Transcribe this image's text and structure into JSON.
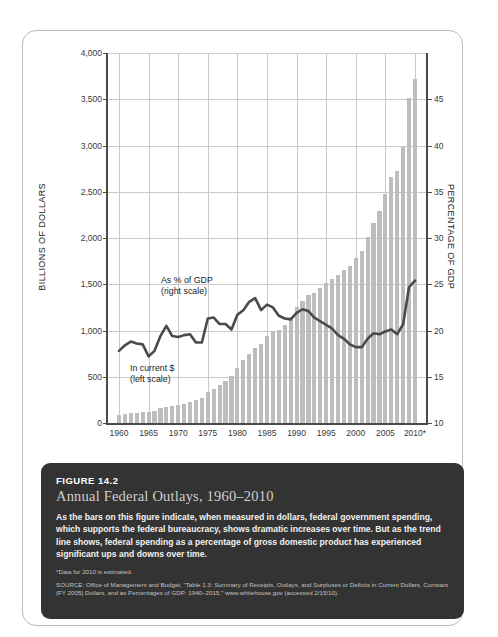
{
  "figure": {
    "number": "FIGURE 14.2",
    "title": "Annual Federal Outlays, 1960–2010",
    "body": "As the bars on this figure indicate, when measured in dollars, federal government spending, which supports the federal bureaucracy, shows dramatic increases over time. But as the trend line shows, federal spending as a percentage of gross domestic product has experienced significant ups and downs over time.",
    "note": "*Data for 2010 is estimated.",
    "source": "SOURCE: Office of Management and Budget, \"Table 1.3: Summary of Receipts, Outlays, and Surpluses or Deficits in Current Dollars, Constant (FY 2005) Dollars, and as Percentages of GDP: 1940–2015,\" www.whitehouse.gov (accessed 2/15/10).",
    "caption_bg": "#333333",
    "card_border": "#b9b9b9"
  },
  "chart_data": {
    "type": "bar",
    "title": "Annual Federal Outlays, 1960–2010",
    "xlabel": "",
    "ylabel": "BILLIONS OF DOLLARS",
    "y2label": "PERCENTAGE OF GDP",
    "ylim": [
      0,
      4000
    ],
    "y2lim": [
      10,
      50
    ],
    "grid": true,
    "legend": "inline-annotations",
    "bar_color": "#bdbdbd",
    "line_color": "#4a4a4a",
    "annotations": [
      {
        "text": "As % of GDP",
        "text2": "(right scale)",
        "series": "percent_of_gdp"
      },
      {
        "text": "In current $",
        "text2": "(left scale)",
        "series": "outlays_billions"
      }
    ],
    "yticks": [
      "0",
      "500",
      "1,000",
      "1,500",
      "2,000",
      "2,500",
      "3,000",
      "3,500",
      "4,000"
    ],
    "ytick_values": [
      0,
      500,
      1000,
      1500,
      2000,
      2500,
      3000,
      3500,
      4000
    ],
    "y2ticks": [
      "10",
      "15",
      "20",
      "25",
      "30",
      "35",
      "40",
      "45"
    ],
    "y2tick_values": [
      10,
      15,
      20,
      25,
      30,
      35,
      40,
      45
    ],
    "xticks": [
      "1960",
      "1965",
      "1970",
      "1975",
      "1980",
      "1985",
      "1990",
      "1995",
      "2000",
      "2005",
      "2010*"
    ],
    "xtick_values": [
      1960,
      1965,
      1970,
      1975,
      1980,
      1985,
      1990,
      1995,
      2000,
      2005,
      2010
    ],
    "x": [
      1960,
      1961,
      1962,
      1963,
      1964,
      1965,
      1966,
      1967,
      1968,
      1969,
      1970,
      1971,
      1972,
      1973,
      1974,
      1975,
      1976,
      1977,
      1978,
      1979,
      1980,
      1981,
      1982,
      1983,
      1984,
      1985,
      1986,
      1987,
      1988,
      1989,
      1990,
      1991,
      1992,
      1993,
      1994,
      1995,
      1996,
      1997,
      1998,
      1999,
      2000,
      2001,
      2002,
      2003,
      2004,
      2005,
      2006,
      2007,
      2008,
      2009,
      2010
    ],
    "series": [
      {
        "name": "In current $ (left scale)",
        "unit": "billions of dollars",
        "axis": "left",
        "render": "bar",
        "values": [
          92,
          98,
          107,
          111,
          119,
          118,
          135,
          157,
          178,
          184,
          196,
          210,
          231,
          246,
          269,
          332,
          372,
          409,
          459,
          504,
          591,
          678,
          746,
          808,
          852,
          946,
          990,
          1004,
          1064,
          1144,
          1253,
          1324,
          1382,
          1409,
          1462,
          1516,
          1561,
          1601,
          1653,
          1702,
          1789,
          1863,
          2011,
          2160,
          2293,
          2472,
          2655,
          2729,
          2983,
          3518,
          3721
        ]
      },
      {
        "name": "As % of GDP (right scale)",
        "unit": "percent of GDP",
        "axis": "right",
        "render": "line",
        "values": [
          17.8,
          18.4,
          18.8,
          18.6,
          18.5,
          17.2,
          17.8,
          19.4,
          20.5,
          19.4,
          19.3,
          19.5,
          19.6,
          18.7,
          18.7,
          21.3,
          21.4,
          20.7,
          20.7,
          20.1,
          21.7,
          22.2,
          23.1,
          23.5,
          22.2,
          22.8,
          22.5,
          21.6,
          21.3,
          21.2,
          21.9,
          22.3,
          22.1,
          21.4,
          21.0,
          20.6,
          20.2,
          19.5,
          19.1,
          18.5,
          18.2,
          18.2,
          19.1,
          19.7,
          19.6,
          19.9,
          20.1,
          19.6,
          20.7,
          24.7,
          25.4
        ]
      }
    ]
  }
}
